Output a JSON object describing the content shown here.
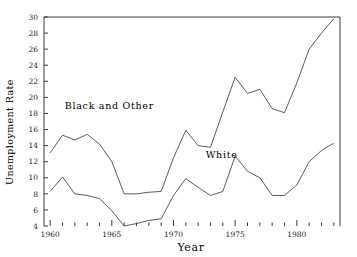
{
  "chart_data": {
    "type": "line",
    "title": "",
    "xlabel": "Year",
    "ylabel": "Unemployment Rate",
    "xlim": [
      1959.5,
      1983.5
    ],
    "ylim": [
      4,
      30
    ],
    "grid": false,
    "legend": "inline-annotations",
    "x": [
      1960,
      1961,
      1962,
      1963,
      1964,
      1965,
      1966,
      1967,
      1968,
      1969,
      1970,
      1971,
      1972,
      1973,
      1974,
      1975,
      1976,
      1977,
      1978,
      1979,
      1980,
      1981,
      1982,
      1983
    ],
    "xticks_major": [
      1960,
      1965,
      1970,
      1975,
      1980
    ],
    "xticks_minor_step": 1,
    "yticks": [
      4,
      6,
      8,
      10,
      12,
      14,
      16,
      18,
      20,
      22,
      24,
      26,
      28,
      30
    ],
    "series": [
      {
        "name": "Black and Other",
        "values": [
          13.1,
          15.3,
          14.7,
          15.4,
          14.2,
          12.0,
          8.0,
          8.0,
          8.2,
          8.3,
          12.5,
          15.9,
          14.0,
          13.8,
          18.2,
          22.5,
          20.5,
          21.0,
          18.6,
          18.1,
          21.8,
          26.0,
          28.0,
          29.8
        ]
      },
      {
        "name": "White",
        "values": [
          8.3,
          10.1,
          8.0,
          7.8,
          7.4,
          5.9,
          4.0,
          4.3,
          4.7,
          4.9,
          7.8,
          9.9,
          8.8,
          7.8,
          8.3,
          12.7,
          10.8,
          10.0,
          7.8,
          7.8,
          9.1,
          12.0,
          13.4,
          14.3
        ]
      }
    ],
    "annotations": [
      {
        "text": "Black and Other",
        "x": 1964.8,
        "y": 18.6
      },
      {
        "text": "White",
        "x": 1973.9,
        "y": 12.5
      }
    ]
  }
}
